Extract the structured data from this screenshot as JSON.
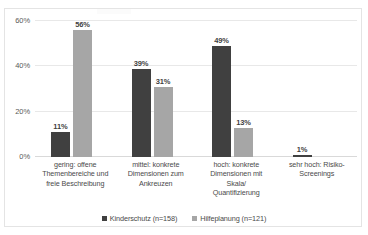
{
  "chart_data": {
    "type": "bar",
    "title": "",
    "xlabel": "",
    "ylabel": "",
    "ylim": [
      0,
      60
    ],
    "yticks": [
      "0%",
      "20%",
      "40%",
      "60%"
    ],
    "ytick_values": [
      0,
      20,
      40,
      60
    ],
    "grid": true,
    "legend_position": "bottom-center",
    "categories": [
      "gering: offene Themenbereiche und freie Beschreibung",
      "mittel: konkrete Dimensionen zum Ankreuzen",
      "hoch: konkrete Dimensionen mit Skala/ Quantifizierung",
      "sehr hoch: Risiko-Screenings"
    ],
    "category_lines": [
      [
        "gering: offene",
        "Themenbereiche und",
        "freie Beschreibung"
      ],
      [
        "mittel: konkrete",
        "Dimensionen zum",
        "Ankreuzen"
      ],
      [
        "hoch: konkrete",
        "Dimensionen mit",
        "Skala/",
        "Quantifizierung"
      ],
      [
        "sehr hoch: Risiko-",
        "Screenings"
      ]
    ],
    "series": [
      {
        "name": "Kinderschutz (n=158)",
        "color": "#404040",
        "values": [
          11,
          39,
          49,
          1
        ],
        "labels": [
          "11%",
          "39%",
          "49%",
          "1%"
        ]
      },
      {
        "name": "Hilfeplanung (n=121)",
        "color": "#a6a6a6",
        "values": [
          56,
          31,
          13,
          null
        ],
        "labels": [
          "56%",
          "31%",
          "13%",
          ""
        ]
      }
    ]
  },
  "colors": {
    "series_dark": "#404040",
    "series_light": "#a6a6a6",
    "gridline": "#e8e8e8",
    "axis": "#d9d9d9",
    "text": "#4a4a4a",
    "border": "#e4e4e4",
    "background": "#ffffff"
  }
}
